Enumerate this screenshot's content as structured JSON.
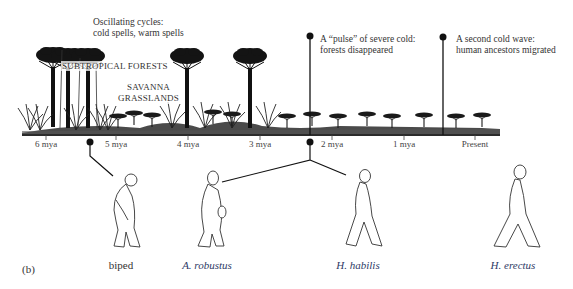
{
  "figure": {
    "panel_label": "(b)",
    "annotations": {
      "oscillating": [
        "Oscillating cycles:",
        "cold spells, warm spells"
      ],
      "pulse": [
        "A “pulse” of severe cold:",
        "forests disappeared"
      ],
      "second_wave": [
        "A second cold wave:",
        "human ancestors migrated"
      ]
    },
    "habitats": {
      "forest": "SUBTROPICAL FORESTS",
      "savanna": [
        "SAVANNA",
        "GRASSLANDS"
      ]
    },
    "timeline": {
      "ticks": [
        {
          "label": "6 mya",
          "x": 46
        },
        {
          "label": "5 mya",
          "x": 116
        },
        {
          "label": "4 mya",
          "x": 188
        },
        {
          "label": "3 mya",
          "x": 260
        },
        {
          "label": "2 mya",
          "x": 332
        },
        {
          "label": "1 mya",
          "x": 404
        },
        {
          "label": "Present",
          "x": 475
        }
      ],
      "events": [
        {
          "name": "biped-origin",
          "x": 90
        },
        {
          "name": "cold-pulse",
          "x": 310
        },
        {
          "name": "second-cold-wave",
          "x": 441
        }
      ]
    },
    "species": [
      {
        "label": "biped",
        "style": "plain",
        "x": 121
      },
      {
        "label": "A. robustus",
        "style": "italic",
        "x": 207
      },
      {
        "label": "H. habilis",
        "style": "italic",
        "x": 358
      },
      {
        "label": "H. erectus",
        "style": "italic",
        "x": 513
      }
    ],
    "colors": {
      "ink": "#1a1a1a",
      "species_label": "#2e3a66",
      "background": "#ffffff"
    }
  }
}
